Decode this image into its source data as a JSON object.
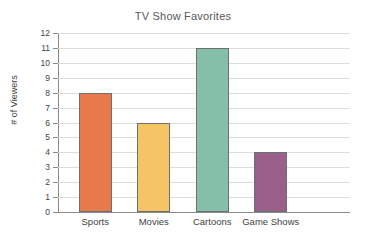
{
  "chart_data": {
    "type": "bar",
    "title": "TV Show Favorites",
    "xlabel": "",
    "ylabel": "# of Viewers",
    "categories": [
      "Sports",
      "Movies",
      "Cartoons",
      "Game Shows"
    ],
    "values": [
      8,
      6,
      11,
      4
    ],
    "ylim": [
      0,
      12
    ],
    "ytick_step": 1,
    "yticks": [
      "12",
      "11",
      "10",
      "9",
      "8",
      "7",
      "6",
      "5",
      "4",
      "3",
      "2",
      "1",
      "0"
    ],
    "grid": true,
    "legend": false,
    "bar_colors": [
      "#e8794a",
      "#f5c465",
      "#86bfa8",
      "#9b5f8c"
    ],
    "bar_edge_color": "#6d6e70",
    "gridline_color": "#dedede",
    "axis_color": "#8a8a8a",
    "title_color": "#57585a",
    "text_color": "#3e3f41",
    "background": "#ffffff"
  }
}
